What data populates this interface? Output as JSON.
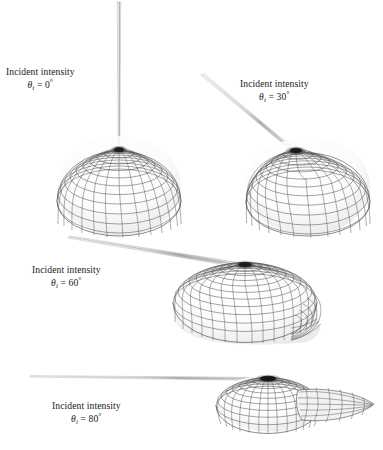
{
  "figure": {
    "kind": "brdf-scattering-lobes",
    "background_color": "#ffffff",
    "ink_color": "#1a1a1a",
    "mesh_color": "#555555",
    "panel_count": 4
  },
  "panels": [
    {
      "id": "panel-0",
      "label_line1": "Incident intensity",
      "theta_symbol": "θ",
      "theta_subscript": "i",
      "equals": "=",
      "angle_value": "0",
      "degree_symbol": "°",
      "angle_deg": 0,
      "spike_direction_deg": 90,
      "lobe_shape": "symmetric-hemispherical",
      "lobe_center_x": 119,
      "lobe_center_y": 186,
      "lobe_rx": 62,
      "lobe_ry": 50,
      "specular_spot_x": 119,
      "specular_spot_y": 150
    },
    {
      "id": "panel-30",
      "label_line1": "Incident intensity",
      "theta_symbol": "θ",
      "theta_subscript": "i",
      "equals": "=",
      "angle_value": "30",
      "degree_symbol": "°",
      "angle_deg": 30,
      "spike_direction_deg": 60,
      "lobe_shape": "slightly-asymmetric-hemispherical",
      "lobe_center_x": 308,
      "lobe_center_y": 186,
      "lobe_rx": 62,
      "lobe_ry": 49,
      "specular_spot_x": 296,
      "specular_spot_y": 152
    },
    {
      "id": "panel-60",
      "label_line1": "Incident intensity",
      "theta_symbol": "θ",
      "theta_subscript": "i",
      "equals": "=",
      "angle_value": "60",
      "degree_symbol": "°",
      "angle_deg": 60,
      "spike_direction_deg": 25,
      "lobe_shape": "flattened-elongated-with-forward-bulge",
      "lobe_center_x": 245,
      "lobe_center_y": 300,
      "lobe_rx": 72,
      "lobe_ry": 42,
      "specular_spot_x": 245,
      "specular_spot_y": 263
    },
    {
      "id": "panel-80",
      "label_line1": "Incident intensity",
      "theta_symbol": "θ",
      "theta_subscript": "i",
      "equals": "=",
      "angle_value": "80",
      "degree_symbol": "°",
      "angle_deg": 80,
      "spike_direction_deg": 8,
      "lobe_shape": "dome-with-forward-scatter-wing",
      "lobe_center_x": 268,
      "lobe_center_y": 404,
      "lobe_rx": 52,
      "lobe_ry": 30,
      "specular_spot_x": 268,
      "specular_spot_y": 378
    }
  ]
}
